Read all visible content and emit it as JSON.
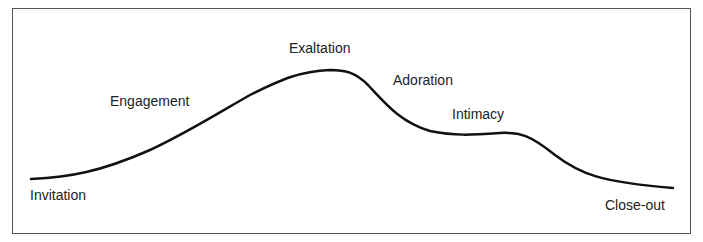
{
  "diagram": {
    "type": "curve",
    "stages": [
      {
        "label": "Invitation",
        "x": 30,
        "y": 187
      },
      {
        "label": "Engagement",
        "x": 110,
        "y": 93
      },
      {
        "label": "Exaltation",
        "x": 289,
        "y": 40
      },
      {
        "label": "Adoration",
        "x": 393,
        "y": 72
      },
      {
        "label": "Intimacy",
        "x": 452,
        "y": 106
      },
      {
        "label": "Close-out",
        "x": 605,
        "y": 197
      }
    ],
    "curve_points": [
      [
        31,
        179
      ],
      [
        90,
        172
      ],
      [
        150,
        150
      ],
      [
        200,
        122
      ],
      [
        250,
        95
      ],
      [
        290,
        75
      ],
      [
        330,
        70
      ],
      [
        350,
        75
      ],
      [
        365,
        82
      ],
      [
        390,
        105
      ],
      [
        420,
        128
      ],
      [
        450,
        135
      ],
      [
        480,
        135
      ],
      [
        510,
        133
      ],
      [
        530,
        140
      ],
      [
        560,
        160
      ],
      [
        590,
        178
      ],
      [
        620,
        185
      ],
      [
        673,
        188
      ]
    ]
  }
}
